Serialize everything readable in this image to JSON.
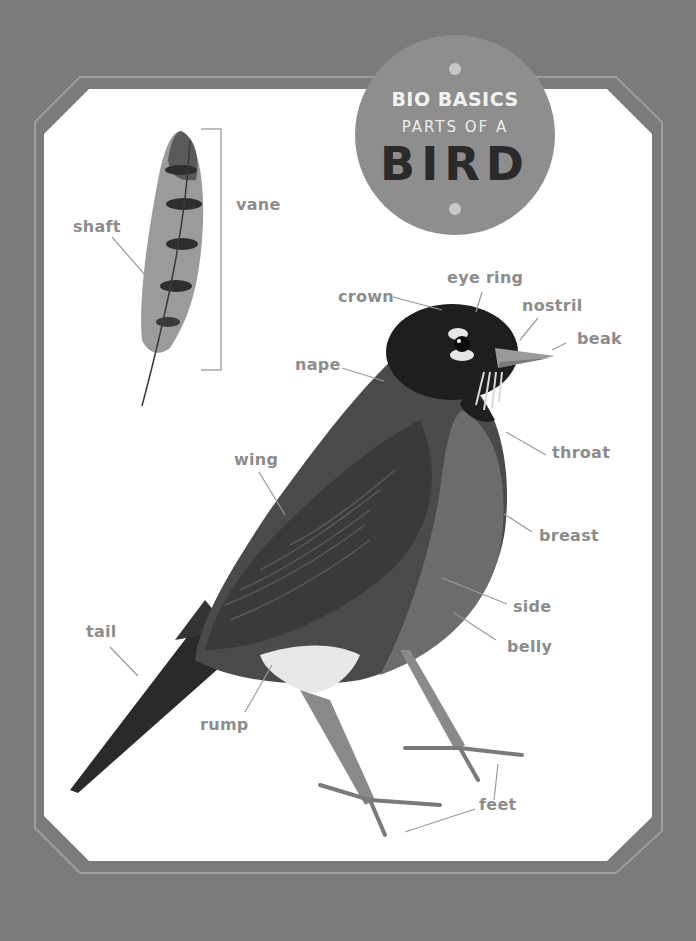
{
  "badge": {
    "line1": "BIO BASICS",
    "line2": "PARTS OF A",
    "line3": "BIRD"
  },
  "feather": {
    "labels": {
      "shaft": "shaft",
      "vane": "vane"
    }
  },
  "bird": {
    "labels": {
      "eye_ring": "eye ring",
      "crown": "crown",
      "nostril": "nostril",
      "beak": "beak",
      "nape": "nape",
      "throat": "throat",
      "wing": "wing",
      "breast": "breast",
      "side": "side",
      "tail": "tail",
      "belly": "belly",
      "rump": "rump",
      "feet": "feet"
    }
  },
  "colors": {
    "background": "#7b7b7b",
    "panel": "#ffffff",
    "badge": "#8e8e8e",
    "label_text": "#8c8c8c",
    "leader_line": "#9a9a9a"
  }
}
